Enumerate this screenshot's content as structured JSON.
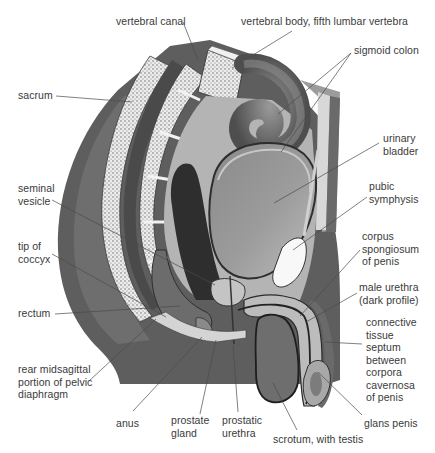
{
  "figure": {
    "colors": {
      "background": "#ffffff",
      "body_dark": "#5e5e5e",
      "body_mid": "#7a7a7a",
      "bone": "#e8e8e8",
      "bone_stipple": "#6a6a6a",
      "bladder": "#9a9a9a",
      "bladder_light": "#b8b8b8",
      "symphysis": "#f6f6f6",
      "leader_line": "#4a4a4a",
      "label_text": "#3a3a3a"
    },
    "labels": [
      {
        "id": "vertebral-canal",
        "text": "vertebral canal",
        "x": 116,
        "y": 15,
        "line": [
          [
            183,
            22
          ],
          [
            198,
            60
          ]
        ]
      },
      {
        "id": "vertebral-body-l5",
        "text": "vertebral body, fifth lumbar vertebra",
        "x": 241,
        "y": 15,
        "line": [
          [
            292,
            31
          ],
          [
            232,
            68
          ]
        ]
      },
      {
        "id": "sigmoid-colon",
        "text": "sigmoid colon",
        "x": 354,
        "y": 44,
        "line": [
          [
            351,
            53
          ],
          [
            278,
            114
          ]
        ],
        "line2": [
          [
            351,
            53
          ],
          [
            281,
            152
          ]
        ]
      },
      {
        "id": "sacrum",
        "text": "sacrum",
        "x": 18,
        "y": 89,
        "line": [
          [
            56,
            96
          ],
          [
            132,
            102
          ]
        ]
      },
      {
        "id": "urinary-bladder",
        "text": "urinary\nbladder",
        "x": 383,
        "y": 132,
        "line": [
          [
            379,
            143
          ],
          [
            274,
            203
          ]
        ]
      },
      {
        "id": "seminal-vesicle",
        "text": "seminal\nvesicle",
        "x": 18,
        "y": 182,
        "line": [
          [
            52,
            200
          ],
          [
            215,
            285
          ]
        ]
      },
      {
        "id": "pubic-symphysis",
        "text": "pubic\nsymphysis",
        "x": 369,
        "y": 180,
        "line": [
          [
            367,
            197
          ],
          [
            293,
            250
          ]
        ]
      },
      {
        "id": "tip-of-coccyx",
        "text": "tip of\ncoccyx",
        "x": 18,
        "y": 240,
        "line": [
          [
            52,
            254
          ],
          [
            166,
            317
          ]
        ]
      },
      {
        "id": "corpus-spongiosum",
        "text": "corpus\nspongiosum\nof penis",
        "x": 362,
        "y": 230,
        "line": [
          [
            360,
            250
          ],
          [
            300,
            316
          ]
        ]
      },
      {
        "id": "male-urethra",
        "text": "male urethra\n(dark profile)",
        "x": 359,
        "y": 281,
        "line": [
          [
            357,
            293
          ],
          [
            306,
            322
          ]
        ]
      },
      {
        "id": "rectum",
        "text": "rectum",
        "x": 18,
        "y": 307,
        "line": [
          [
            55,
            314
          ],
          [
            180,
            306
          ]
        ]
      },
      {
        "id": "connective-tissue-septum",
        "text": "connective\ntissue\nseptum\nbetween\ncorpora\ncavernosa\nof penis",
        "x": 366,
        "y": 316,
        "line": [
          [
            362,
            344
          ],
          [
            325,
            342
          ]
        ]
      },
      {
        "id": "rear-pelvic-diaphragm",
        "text": "rear midsagittal\nportion of pelvic\ndiaphragm",
        "x": 18,
        "y": 363,
        "line": [
          [
            89,
            381
          ],
          [
            156,
            319
          ]
        ]
      },
      {
        "id": "anus",
        "text": "anus",
        "x": 116,
        "y": 417,
        "line": [
          [
            133,
            411
          ],
          [
            202,
            337
          ]
        ]
      },
      {
        "id": "prostate-gland",
        "text": "prostate\ngland",
        "x": 171,
        "y": 414,
        "line": [
          [
            200,
            414
          ],
          [
            216,
            340
          ]
        ]
      },
      {
        "id": "prostatic-urethra",
        "text": "prostatic\nurethra",
        "x": 222,
        "y": 414,
        "line": [
          [
            238,
            412
          ],
          [
            233,
            345
          ]
        ]
      },
      {
        "id": "glans-penis",
        "text": "glans penis",
        "x": 364,
        "y": 417,
        "line": [
          [
            362,
            415
          ],
          [
            318,
            372
          ]
        ]
      },
      {
        "id": "scrotum-testis",
        "text": "scrotum, with testis",
        "x": 273,
        "y": 433,
        "line": [
          [
            297,
            430
          ],
          [
            273,
            383
          ]
        ]
      }
    ]
  }
}
